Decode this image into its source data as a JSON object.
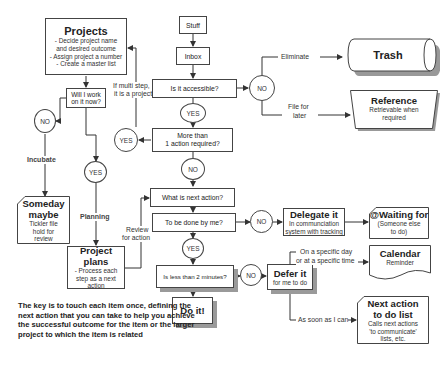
{
  "diagram": {
    "type": "flowchart",
    "nodes": {
      "stuff": {
        "label": "Stuff"
      },
      "inbox": {
        "label": "Inbox"
      },
      "accessible": {
        "label": "Is it accessible?"
      },
      "more_than_one": {
        "line1": "More than",
        "line2": "1 action required?"
      },
      "next_action": {
        "label": "What is next action?"
      },
      "done_by_me": {
        "label": "To be done by me?"
      },
      "less_than_2": {
        "label": "Is less than 2 minutes?"
      },
      "do_it": {
        "label": "Do it!"
      },
      "projects": {
        "title": "Projects",
        "lines": [
          "- Decide project name",
          "and desired outcome",
          "- Assign project a number",
          "- Create a master list"
        ]
      },
      "will_i_work": {
        "line1": "Will I work",
        "line2": "on it now?"
      },
      "someday": {
        "title1": "Someday",
        "title2": "maybe",
        "lines": [
          "Tickler file",
          "hold for",
          "review"
        ]
      },
      "project_plans": {
        "title": "Project plans",
        "lines": [
          "- Process each",
          "step as a next",
          "action"
        ]
      },
      "trash": {
        "title": "Trash"
      },
      "reference": {
        "title": "Reference",
        "lines": [
          "Retrievable when",
          "required"
        ]
      },
      "delegate": {
        "title": "Delegate it",
        "lines": [
          "In communciation",
          "system with tracking"
        ]
      },
      "waiting": {
        "title": "@Waiting for",
        "lines": [
          "(Someone else",
          "to do)"
        ]
      },
      "defer": {
        "title": "Defer it",
        "lines": [
          "for me to do"
        ]
      },
      "calendar": {
        "title": "Calendar",
        "lines": [
          "Reminder"
        ]
      },
      "next_list": {
        "title1": "Next action",
        "title2": "to do list",
        "lines": [
          "Calls next actions",
          "'to communicate'",
          "lists, etc."
        ]
      }
    },
    "decisions": {
      "no": "NO",
      "yes": "YES"
    },
    "edge_labels": {
      "eliminate": "Eliminate",
      "file_line1": "File for",
      "file_line2": "later",
      "multi_line1": "If multi step,",
      "multi_line2": "it is a project",
      "incubate": "Incubate",
      "planning": "Planning",
      "review_line1": "Review",
      "review_line2": "for action",
      "specific_line1": "On a specific day",
      "specific_line2": "or at a specific time",
      "asap": "As soon as I can"
    },
    "note": "The key is to touch each item once, defining the next action that you can take to help you achieve the successful outcome for the item or the larger project to which the item is related"
  }
}
